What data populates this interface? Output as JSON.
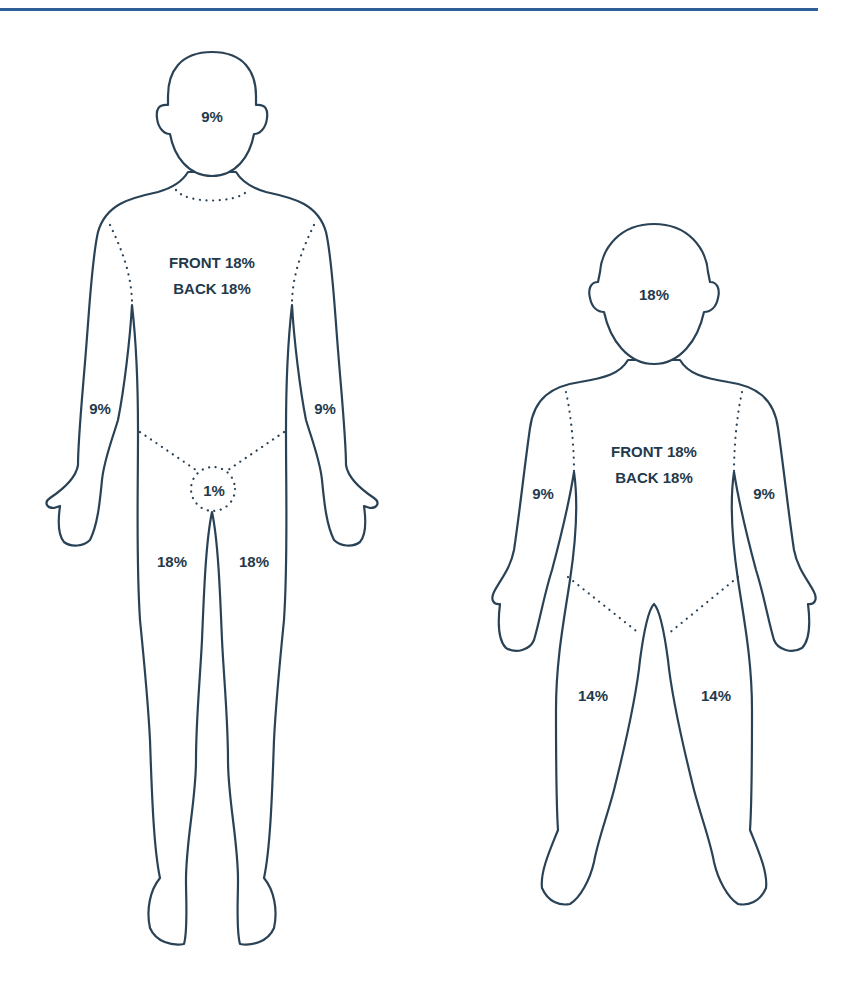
{
  "diagram": {
    "type": "rule-of-nines burn surface area chart",
    "accent_color": "#2f5f99",
    "line_color": "#2a4255",
    "label_color": "#1f3a4c",
    "adult": {
      "head": "9%",
      "trunk_front": "FRONT 18%",
      "trunk_back": "BACK 18%",
      "left_arm": "9%",
      "right_arm": "9%",
      "groin": "1%",
      "left_leg": "18%",
      "right_leg": "18%"
    },
    "child": {
      "head": "18%",
      "trunk_front": "FRONT 18%",
      "trunk_back": "BACK 18%",
      "left_arm": "9%",
      "right_arm": "9%",
      "left_leg": "14%",
      "right_leg": "14%"
    }
  }
}
